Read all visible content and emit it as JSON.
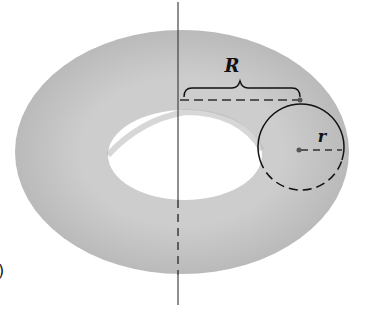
{
  "diagram": {
    "labels": {
      "major_radius": "R",
      "minor_radius": "r",
      "corner_mark": ")"
    },
    "colors": {
      "torus_fill": "#c4c4c4",
      "torus_shade": "#b2b2b2",
      "line": "#222222",
      "dash": "#555555",
      "background": "#ffffff"
    }
  }
}
